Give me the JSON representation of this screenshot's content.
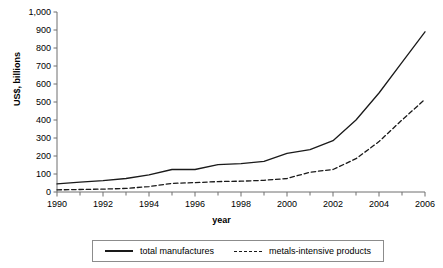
{
  "chart_data": {
    "type": "line",
    "title": "",
    "xlabel": "year",
    "ylabel": "US$, billions",
    "xlim": [
      1990,
      2006
    ],
    "ylim": [
      0,
      1000
    ],
    "grid": false,
    "legend_position": "bottom",
    "x": [
      1990,
      1991,
      1992,
      1993,
      1994,
      1995,
      1996,
      1997,
      1998,
      1999,
      2000,
      2001,
      2002,
      2003,
      2004,
      2005,
      2006
    ],
    "xtick_labels": [
      "1990",
      "1992",
      "1994",
      "1996",
      "1998",
      "2000",
      "2002",
      "2004",
      "2006"
    ],
    "xtick_values": [
      1990,
      1992,
      1994,
      1996,
      1998,
      2000,
      2002,
      2004,
      2006
    ],
    "ytick_labels": [
      "0",
      "100",
      "200",
      "300",
      "400",
      "500",
      "600",
      "700",
      "800",
      "900",
      "1,000"
    ],
    "ytick_values": [
      0,
      100,
      200,
      300,
      400,
      500,
      600,
      700,
      800,
      900,
      1000
    ],
    "series": [
      {
        "name": "total manufactures",
        "style": "solid",
        "color": "#1a1a1a",
        "values": [
          45,
          55,
          63,
          75,
          95,
          125,
          125,
          152,
          158,
          170,
          215,
          235,
          285,
          400,
          550,
          720,
          890
        ]
      },
      {
        "name": "metals-intensive products",
        "style": "dashed",
        "color": "#1a1a1a",
        "values": [
          12,
          14,
          16,
          20,
          30,
          48,
          52,
          58,
          60,
          65,
          75,
          110,
          125,
          185,
          280,
          400,
          515
        ]
      }
    ]
  },
  "legend": {
    "items": [
      {
        "label": "total manufactures",
        "style": "solid"
      },
      {
        "label": "metals-intensive products",
        "style": "dashed"
      }
    ]
  },
  "axes": {
    "x_title": "year",
    "y_title": "US$, billions"
  }
}
